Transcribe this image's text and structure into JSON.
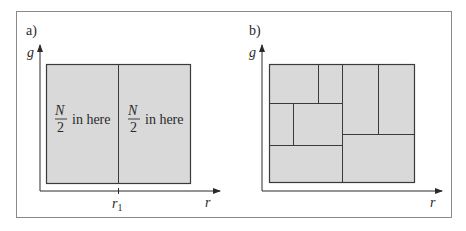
{
  "figure": {
    "colors": {
      "fill": "#d9d9d9",
      "stroke": "#3a3a3a",
      "frame": "#8a8a8a"
    },
    "panel_a": {
      "label": "a)",
      "y_axis": "g",
      "x_axis": "r",
      "tick_label": "r",
      "tick_sub": "1",
      "left_region": {
        "numerator": "N",
        "denominator": "2",
        "text": "in here"
      },
      "right_region": {
        "numerator": "N",
        "denominator": "2",
        "text": "in here"
      }
    },
    "panel_b": {
      "label": "b)",
      "y_axis": "g",
      "x_axis": "r"
    }
  }
}
